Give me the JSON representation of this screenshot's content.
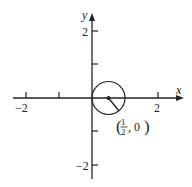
{
  "diagram": {
    "type": "coordinate-plane",
    "x_axis": {
      "label": "x",
      "ticks": [
        -2,
        -1,
        1,
        2
      ],
      "labeled_ticks": [
        {
          "value": -2,
          "text": "−2"
        },
        {
          "value": 2,
          "text": "2"
        }
      ]
    },
    "y_axis": {
      "label": "y",
      "ticks": [
        -2,
        -1,
        1,
        2
      ],
      "labeled_ticks": [
        {
          "value": 2,
          "text": "2"
        },
        {
          "value": -2,
          "text": "−2"
        }
      ]
    },
    "circle": {
      "center": [
        0.5,
        0
      ],
      "radius": 0.5
    },
    "annotation": {
      "point_label_num": "1",
      "point_label_den": "2",
      "point_label_rest": ", 0",
      "text": "(1/2, 0)"
    },
    "colors": {
      "ink": "#222222",
      "background": "#ffffff"
    }
  }
}
